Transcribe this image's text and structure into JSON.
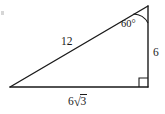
{
  "figure": {
    "background_color": "#ffffff",
    "stroke_color": "#1a1a1a",
    "text_color": "#1a1a1a",
    "labels": {
      "hypotenuse": "12",
      "vertical_leg": "6",
      "base_coefficient": "6",
      "base_radical_sign": "√",
      "base_radicand": "3",
      "base_full": "6√3",
      "angle": "60°"
    },
    "geometry": {
      "vertex_left": [
        10,
        87
      ],
      "vertex_bottom_right": [
        148,
        87
      ],
      "vertex_top_right": [
        148,
        6
      ],
      "right_angle_marker_size": 9,
      "angle_arc_radius": 17
    }
  }
}
